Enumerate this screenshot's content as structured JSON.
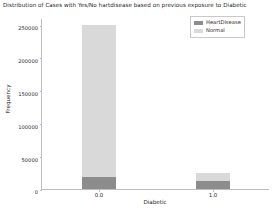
{
  "chart_data": {
    "type": "bar",
    "title": "Distribution of Cases with Yes/No hartdisease based on previous exposure to Diabetic",
    "xlabel": "Diabetic",
    "ylabel": "Frequency",
    "categories": [
      "0.0",
      "1.0"
    ],
    "series": [
      {
        "name": "HeartDisease",
        "values": [
          18000,
          12000
        ],
        "color": "#8c8c8c"
      },
      {
        "name": "Normal",
        "values": [
          250000,
          24500
        ],
        "color": "#d9d9d9"
      }
    ],
    "ylim": [
      0,
      260000
    ],
    "yticks": [
      0,
      50000,
      100000,
      150000,
      200000,
      250000
    ],
    "ytick_labels": [
      "0",
      "50000",
      "100000",
      "150000",
      "200000",
      "250000"
    ],
    "xticks": [
      "0.0",
      "1.0"
    ],
    "grid": false,
    "legend_position": "upper right",
    "stacked": true
  },
  "legend": {
    "items": [
      {
        "label": "HeartDisease",
        "swatch": "heart"
      },
      {
        "label": "Normal",
        "swatch": "normal"
      }
    ]
  }
}
